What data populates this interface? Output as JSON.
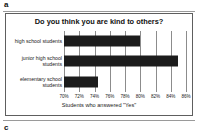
{
  "panels": {
    "top_label": "a",
    "bottom_label": "c"
  },
  "chart_data": {
    "type": "bar",
    "orientation": "horizontal",
    "title": "Do you think you are kind to others?",
    "xlabel": "Students who answered \"Yes\"",
    "ylabel": "",
    "categories": [
      "high school students",
      "junior high school students",
      "elementary school students"
    ],
    "values": [
      80.0,
      85.0,
      74.5
    ],
    "value_labels": [
      "80%",
      "85%",
      "74.5%"
    ],
    "xlim": [
      70,
      86
    ],
    "xticks": [
      70,
      72,
      74,
      76,
      78,
      80,
      82,
      84,
      86
    ],
    "xtick_labels": [
      "70%",
      "72%",
      "74%",
      "76%",
      "78%",
      "80%",
      "82%",
      "84%",
      "86%"
    ],
    "grid": true,
    "grid_axis": "x",
    "legend": false,
    "bar_color": "#1c1c1c",
    "grid_color": "#8c8c8c",
    "background_color": "#ffffff",
    "border_color": "#5e5e5e"
  }
}
